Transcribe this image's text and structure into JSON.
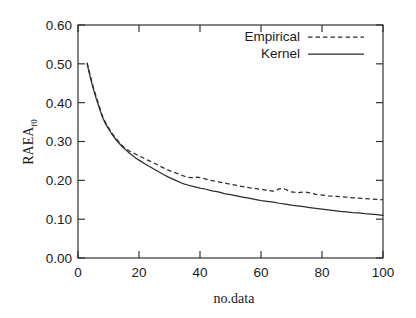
{
  "chart_data": {
    "type": "line",
    "title": "",
    "xlabel": "no.data",
    "ylabel": "RAEA",
    "ylabel_subscript": "f0",
    "xlim": [
      0,
      100
    ],
    "ylim": [
      0.0,
      0.6
    ],
    "grid": false,
    "legend_position": "top-right-inside",
    "xticks": [
      0,
      20,
      40,
      60,
      80,
      100
    ],
    "xtick_labels": [
      "0",
      "20",
      "40",
      "60",
      "80",
      "100"
    ],
    "yticks": [
      0.0,
      0.1,
      0.2,
      0.3,
      0.4,
      0.5,
      0.6
    ],
    "ytick_labels": [
      "0.00",
      "0.10",
      "0.20",
      "0.30",
      "0.40",
      "0.50",
      "0.60"
    ],
    "series": [
      {
        "name": "Empirical",
        "style": "dashed",
        "color": "#2b2b2b",
        "x": [
          3,
          4,
          5,
          6,
          7,
          8,
          9,
          10,
          11,
          12,
          13,
          14,
          15,
          16,
          17,
          18,
          19,
          20,
          22,
          24,
          26,
          28,
          30,
          32,
          34,
          35,
          36,
          37,
          38,
          39,
          40,
          42,
          44,
          46,
          48,
          50,
          52,
          54,
          56,
          58,
          60,
          62,
          64,
          65,
          66,
          67,
          68,
          69,
          70,
          72,
          74,
          76,
          78,
          80,
          82,
          84,
          86,
          88,
          90,
          92,
          94,
          96,
          98,
          100
        ],
        "y": [
          0.503,
          0.47,
          0.44,
          0.414,
          0.39,
          0.366,
          0.349,
          0.336,
          0.323,
          0.312,
          0.303,
          0.294,
          0.286,
          0.28,
          0.275,
          0.271,
          0.267,
          0.263,
          0.255,
          0.248,
          0.24,
          0.232,
          0.225,
          0.219,
          0.213,
          0.21,
          0.208,
          0.207,
          0.207,
          0.208,
          0.207,
          0.203,
          0.199,
          0.196,
          0.193,
          0.19,
          0.187,
          0.184,
          0.181,
          0.179,
          0.177,
          0.174,
          0.172,
          0.175,
          0.178,
          0.179,
          0.177,
          0.173,
          0.17,
          0.168,
          0.17,
          0.168,
          0.164,
          0.162,
          0.16,
          0.159,
          0.158,
          0.157,
          0.155,
          0.154,
          0.153,
          0.152,
          0.151,
          0.15
        ]
      },
      {
        "name": "Kernel",
        "style": "solid",
        "color": "#2b2b2b",
        "x": [
          3,
          4,
          5,
          6,
          7,
          8,
          9,
          10,
          11,
          12,
          13,
          14,
          15,
          16,
          17,
          18,
          19,
          20,
          22,
          24,
          26,
          28,
          30,
          32,
          34,
          35,
          36,
          38,
          40,
          42,
          44,
          46,
          48,
          50,
          52,
          54,
          56,
          58,
          60,
          62,
          64,
          66,
          68,
          70,
          72,
          74,
          76,
          78,
          80,
          82,
          84,
          86,
          88,
          90,
          92,
          94,
          96,
          98,
          100
        ],
        "y": [
          0.5,
          0.466,
          0.436,
          0.41,
          0.386,
          0.363,
          0.346,
          0.333,
          0.32,
          0.309,
          0.3,
          0.291,
          0.283,
          0.276,
          0.269,
          0.263,
          0.257,
          0.252,
          0.242,
          0.233,
          0.224,
          0.215,
          0.207,
          0.2,
          0.193,
          0.19,
          0.188,
          0.184,
          0.18,
          0.177,
          0.173,
          0.17,
          0.166,
          0.163,
          0.16,
          0.157,
          0.154,
          0.151,
          0.148,
          0.146,
          0.144,
          0.141,
          0.139,
          0.136,
          0.134,
          0.132,
          0.13,
          0.128,
          0.126,
          0.124,
          0.122,
          0.12,
          0.119,
          0.117,
          0.116,
          0.114,
          0.113,
          0.112,
          0.11
        ]
      }
    ],
    "legend_entries": [
      {
        "label": "Empirical",
        "style": "dashed"
      },
      {
        "label": "Kernel",
        "style": "solid"
      }
    ]
  }
}
